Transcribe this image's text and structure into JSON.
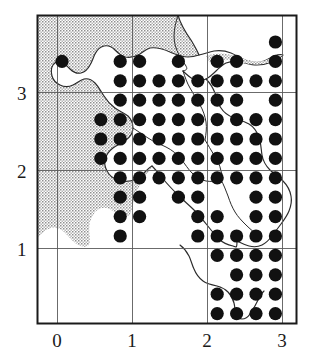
{
  "figure": {
    "type": "distribution-dot-map",
    "title": ""
  },
  "axes": {
    "x_ticks": [
      "0",
      "1",
      "2",
      "3"
    ],
    "y_ticks": [
      "1",
      "2",
      "3"
    ],
    "x_range": [
      -0.27,
      3.2
    ],
    "y_range": [
      -0.3,
      3.68
    ],
    "grid": true,
    "frame": true
  },
  "colors": {
    "frame": "#1a1a1a",
    "grid": "#4a4a4a",
    "dot": "#111111",
    "coastline": "#2b2b2b",
    "sea_fill": "#c9c9c9",
    "land_fill": "#ffffff",
    "background": "#ffffff",
    "label": "#1a1a1a"
  },
  "legend": {
    "dot_meaning": "record present",
    "shaded_meaning": "sea / outside study area",
    "visible": false
  },
  "chart_data": {
    "type": "scatter",
    "title": "",
    "xlabel": "",
    "ylabel": "",
    "xlim": [
      -0.27,
      3.2
    ],
    "ylim": [
      -0.3,
      3.68
    ],
    "grid": true,
    "legend_position": "none",
    "marker": "filled-circle",
    "marker_size_px": 13,
    "grid_step_units": 0.25,
    "categories": [
      "0",
      "1",
      "2",
      "3"
    ],
    "series": [
      {
        "name": "records",
        "count": 176,
        "points": [
          [
            0.03,
            3.25
          ],
          [
            0.62,
            3.5
          ],
          [
            0.88,
            3.25
          ],
          [
            1.13,
            3.5
          ],
          [
            1.38,
            3.25
          ],
          [
            0.62,
            3.25
          ],
          [
            1.63,
            3.25
          ],
          [
            1.88,
            3.25
          ],
          [
            2.13,
            3.5
          ],
          [
            2.38,
            3.5
          ],
          [
            2.13,
            3.25
          ],
          [
            2.38,
            3.25
          ],
          [
            2.63,
            3.25
          ],
          [
            0.38,
            3.0
          ],
          [
            0.62,
            3.0
          ],
          [
            0.88,
            3.0
          ],
          [
            1.13,
            3.0
          ],
          [
            1.38,
            3.0
          ],
          [
            1.63,
            3.0
          ],
          [
            1.88,
            3.0
          ],
          [
            2.13,
            3.0
          ],
          [
            2.38,
            3.0
          ],
          [
            2.63,
            3.0
          ],
          [
            2.88,
            3.0
          ],
          [
            0.38,
            2.75
          ],
          [
            0.62,
            2.75
          ],
          [
            0.88,
            2.75
          ],
          [
            1.13,
            2.75
          ],
          [
            1.38,
            2.75
          ],
          [
            1.63,
            2.75
          ],
          [
            1.88,
            2.75
          ],
          [
            2.13,
            2.75
          ],
          [
            2.38,
            2.75
          ],
          [
            2.63,
            2.75
          ],
          [
            0.38,
            2.5
          ],
          [
            0.62,
            2.5
          ],
          [
            0.88,
            2.5
          ],
          [
            1.13,
            2.5
          ],
          [
            1.38,
            2.5
          ],
          [
            1.63,
            2.5
          ],
          [
            1.88,
            2.5
          ],
          [
            2.13,
            2.5
          ],
          [
            2.38,
            2.5
          ],
          [
            2.63,
            2.5
          ],
          [
            2.88,
            2.5
          ],
          [
            0.38,
            2.25
          ],
          [
            0.62,
            2.25
          ],
          [
            0.88,
            2.25
          ],
          [
            1.13,
            2.25
          ],
          [
            1.38,
            2.25
          ],
          [
            1.63,
            2.25
          ],
          [
            1.88,
            2.25
          ],
          [
            2.13,
            2.25
          ],
          [
            2.38,
            2.25
          ],
          [
            2.63,
            2.25
          ],
          [
            0.62,
            2.0
          ],
          [
            0.88,
            2.0
          ],
          [
            1.13,
            2.0
          ],
          [
            1.38,
            2.0
          ],
          [
            1.63,
            2.0
          ],
          [
            1.88,
            2.0
          ],
          [
            2.13,
            2.0
          ],
          [
            2.38,
            2.0
          ],
          [
            2.63,
            2.0
          ],
          [
            2.88,
            2.0
          ],
          [
            0.88,
            1.75
          ],
          [
            1.13,
            1.75
          ],
          [
            1.63,
            1.75
          ],
          [
            2.38,
            1.75
          ],
          [
            2.63,
            1.75
          ],
          [
            2.88,
            1.75
          ],
          [
            0.88,
            1.5
          ],
          [
            1.13,
            1.5
          ],
          [
            1.63,
            1.5
          ],
          [
            1.88,
            1.5
          ],
          [
            2.38,
            1.5
          ],
          [
            2.63,
            1.5
          ],
          [
            2.88,
            1.5
          ],
          [
            0.88,
            1.25
          ],
          [
            1.63,
            1.25
          ],
          [
            1.88,
            1.25
          ],
          [
            2.13,
            1.25
          ],
          [
            2.38,
            1.25
          ],
          [
            2.63,
            1.25
          ],
          [
            2.88,
            1.25
          ],
          [
            1.88,
            1.0
          ],
          [
            2.13,
            1.0
          ],
          [
            2.38,
            1.0
          ],
          [
            2.63,
            1.0
          ],
          [
            2.88,
            1.0
          ],
          [
            2.13,
            0.88
          ],
          [
            2.38,
            0.88
          ],
          [
            2.63,
            0.88
          ],
          [
            2.88,
            0.88
          ],
          [
            1.88,
            0.75
          ],
          [
            2.13,
            0.75
          ],
          [
            2.38,
            0.75
          ],
          [
            2.63,
            0.75
          ],
          [
            1.88,
            0.5
          ],
          [
            2.13,
            0.5
          ],
          [
            2.38,
            0.5
          ],
          [
            2.63,
            0.5
          ],
          [
            2.13,
            0.3
          ],
          [
            2.38,
            0.3
          ],
          [
            2.63,
            0.3
          ],
          [
            2.38,
            0.12
          ]
        ]
      }
    ]
  },
  "dot_grid": {
    "origin_px": [
      62,
      42
    ],
    "step_px": 19.4,
    "radius_px": 6.6,
    "cells": [
      {
        "r": 0,
        "c": [
          11,
          12
        ]
      },
      {
        "r": 1,
        "c": [
          0,
          3,
          4,
          6,
          8,
          9,
          11,
          12,
          13
        ]
      },
      {
        "r": 2,
        "c": [
          3,
          4,
          5,
          6,
          7,
          8,
          9,
          10,
          11,
          12
        ]
      },
      {
        "r": 3,
        "c": [
          3,
          4,
          5,
          6,
          7,
          8,
          9,
          11,
          12
        ]
      },
      {
        "r": 4,
        "c": [
          2,
          3,
          4,
          5,
          6,
          7,
          8,
          9,
          10,
          11,
          12
        ]
      },
      {
        "r": 5,
        "c": [
          2,
          3,
          4,
          5,
          6,
          7,
          8,
          9,
          10,
          11,
          12
        ]
      },
      {
        "r": 6,
        "c": [
          2,
          3,
          4,
          5,
          6,
          7,
          8,
          9,
          10,
          11
        ]
      },
      {
        "r": 7,
        "c": [
          3,
          4,
          5,
          6,
          7,
          8,
          9,
          10,
          11,
          12
        ]
      },
      {
        "r": 8,
        "c": [
          3,
          4,
          6,
          7,
          10,
          11,
          12
        ]
      },
      {
        "r": 9,
        "c": [
          3,
          4,
          7,
          8,
          10,
          11,
          12
        ]
      },
      {
        "r": 10,
        "c": [
          3,
          7,
          8,
          9,
          10,
          11,
          12
        ]
      },
      {
        "r": 11,
        "c": [
          8,
          9,
          10,
          11,
          12
        ]
      },
      {
        "r": 12,
        "c": [
          9,
          10,
          11,
          12
        ]
      },
      {
        "r": 13,
        "c": [
          8,
          9,
          10,
          11
        ]
      },
      {
        "r": 14,
        "c": [
          8,
          9,
          10,
          11
        ]
      },
      {
        "r": 15,
        "c": [
          9,
          10,
          11
        ]
      },
      {
        "r": 16,
        "c": [
          10
        ]
      }
    ]
  }
}
